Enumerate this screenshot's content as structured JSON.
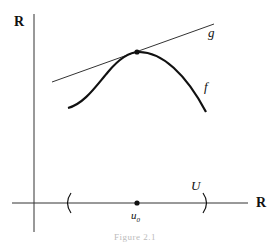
{
  "diagram": {
    "axes": {
      "vertical_label": "R",
      "horizontal_label": "R"
    },
    "curves": {
      "f_label": "f",
      "g_label": "g"
    },
    "interval": {
      "open_paren": "(",
      "close_paren": ")",
      "label": "U"
    },
    "point": {
      "label_base": "u",
      "label_sub": "0"
    },
    "caption": "Figure 2.1",
    "colors": {
      "stroke": "#111111",
      "background": "#ffffff"
    }
  }
}
